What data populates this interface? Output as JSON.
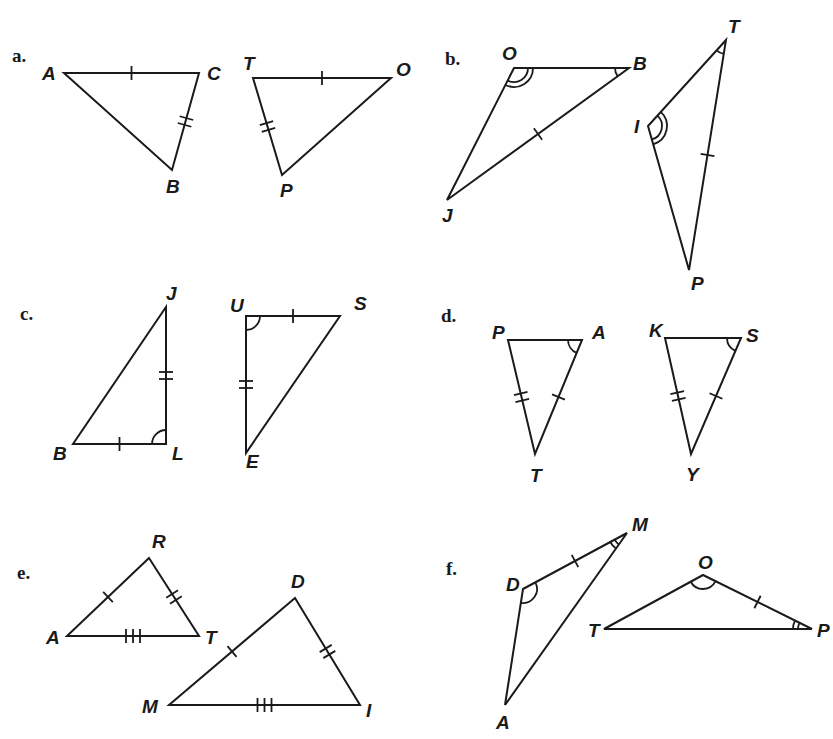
{
  "problems": [
    {
      "label": "a.",
      "label_pos": [
        12,
        62
      ],
      "triangles": [
        {
          "name": "ABC",
          "vertices": {
            "A": [
              64,
              73
            ],
            "C": [
              199,
              73
            ],
            "B": [
              172,
              170
            ]
          },
          "label_pos": {
            "A": [
              42,
              80
            ],
            "C": [
              207,
              80
            ],
            "B": [
              166,
              193
            ]
          },
          "ticks": [
            {
              "side": [
                "A",
                "C"
              ],
              "count": 1
            },
            {
              "side": [
                "C",
                "B"
              ],
              "count": 2
            }
          ],
          "arcs": []
        },
        {
          "name": "TOP",
          "vertices": {
            "T": [
              253,
              78
            ],
            "O": [
              391,
              78
            ],
            "P": [
              282,
              175
            ]
          },
          "label_pos": {
            "T": [
              243,
              70
            ],
            "O": [
              396,
              76
            ],
            "P": [
              280,
              197
            ]
          },
          "ticks": [
            {
              "side": [
                "T",
                "O"
              ],
              "count": 1
            },
            {
              "side": [
                "T",
                "P"
              ],
              "count": 2
            }
          ],
          "arcs": []
        }
      ]
    },
    {
      "label": "b.",
      "label_pos": [
        445,
        65
      ],
      "triangles": [
        {
          "name": "OBJ",
          "vertices": {
            "O": [
              514,
              68
            ],
            "B": [
              629,
              68
            ],
            "J": [
              447,
              200
            ]
          },
          "label_pos": {
            "O": [
              502,
              60
            ],
            "B": [
              633,
              70
            ],
            "J": [
              442,
              222
            ]
          },
          "ticks": [
            {
              "side": [
                "B",
                "J"
              ],
              "count": 1
            }
          ],
          "arcs": [
            {
              "at": "O",
              "count": 2
            },
            {
              "at": "B",
              "count": 1
            }
          ]
        },
        {
          "name": "TIP",
          "vertices": {
            "T": [
              726,
              40
            ],
            "I": [
              648,
              126
            ],
            "P": [
              689,
              270
            ]
          },
          "label_pos": {
            "T": [
              728,
              33
            ],
            "I": [
              634,
              133
            ],
            "P": [
              691,
              290
            ]
          },
          "ticks": [
            {
              "side": [
                "T",
                "P"
              ],
              "count": 1
            }
          ],
          "arcs": [
            {
              "at": "I",
              "count": 2
            },
            {
              "at": "T",
              "count": 1
            }
          ]
        }
      ]
    },
    {
      "label": "c.",
      "label_pos": [
        20,
        320
      ],
      "triangles": [
        {
          "name": "JLB",
          "vertices": {
            "J": [
              166,
              307
            ],
            "L": [
              166,
              444
            ],
            "B": [
              73,
              444
            ]
          },
          "label_pos": {
            "J": [
              166,
              300
            ],
            "L": [
              172,
              460
            ],
            "B": [
              53,
              460
            ]
          },
          "ticks": [
            {
              "side": [
                "B",
                "L"
              ],
              "count": 1
            },
            {
              "side": [
                "J",
                "L"
              ],
              "count": 2
            }
          ],
          "arcs": [
            {
              "at": "L",
              "count": 1
            }
          ]
        },
        {
          "name": "USE",
          "vertices": {
            "U": [
              246,
              316
            ],
            "S": [
              340,
              316
            ],
            "E": [
              246,
              453
            ]
          },
          "label_pos": {
            "U": [
              230,
              312
            ],
            "S": [
              354,
              310
            ],
            "E": [
              246,
              468
            ]
          },
          "ticks": [
            {
              "side": [
                "U",
                "S"
              ],
              "count": 1
            },
            {
              "side": [
                "U",
                "E"
              ],
              "count": 2
            }
          ],
          "arcs": [
            {
              "at": "U",
              "count": 1
            }
          ]
        }
      ]
    },
    {
      "label": "d.",
      "label_pos": [
        441,
        322
      ],
      "triangles": [
        {
          "name": "PAT",
          "vertices": {
            "P": [
              508,
              340
            ],
            "A": [
              582,
              340
            ],
            "T": [
              535,
              454
            ]
          },
          "label_pos": {
            "P": [
              492,
              339
            ],
            "A": [
              592,
              339
            ],
            "T": [
              530,
              482
            ]
          },
          "ticks": [
            {
              "side": [
                "A",
                "T"
              ],
              "count": 1
            },
            {
              "side": [
                "P",
                "T"
              ],
              "count": 2
            }
          ],
          "arcs": [
            {
              "at": "A",
              "count": 1
            }
          ]
        },
        {
          "name": "KSY",
          "vertices": {
            "K": [
              665,
              338
            ],
            "S": [
              741,
              338
            ],
            "Y": [
              691,
              454
            ]
          },
          "label_pos": {
            "K": [
              649,
              337
            ],
            "S": [
              746,
              342
            ],
            "Y": [
              686,
              481
            ]
          },
          "ticks": [
            {
              "side": [
                "S",
                "Y"
              ],
              "count": 1
            },
            {
              "side": [
                "K",
                "Y"
              ],
              "count": 2
            }
          ],
          "arcs": [
            {
              "at": "S",
              "count": 1
            }
          ]
        }
      ]
    },
    {
      "label": "e.",
      "label_pos": [
        17,
        579
      ],
      "triangles": [
        {
          "name": "RAT",
          "vertices": {
            "R": [
              149,
              558
            ],
            "A": [
              67,
              636
            ],
            "T": [
              199,
              636
            ]
          },
          "label_pos": {
            "R": [
              152,
              548
            ],
            "A": [
              46,
              644
            ],
            "T": [
              205,
              644
            ]
          },
          "ticks": [
            {
              "side": [
                "A",
                "R"
              ],
              "count": 1
            },
            {
              "side": [
                "R",
                "T"
              ],
              "count": 2
            },
            {
              "side": [
                "A",
                "T"
              ],
              "count": 3
            }
          ],
          "arcs": []
        },
        {
          "name": "DMI",
          "vertices": {
            "D": [
              295,
              598
            ],
            "M": [
              169,
              705
            ],
            "I": [
              360,
              705
            ]
          },
          "label_pos": {
            "D": [
              291,
              588
            ],
            "M": [
              142,
              713
            ],
            "I": [
              366,
              717
            ]
          },
          "ticks": [
            {
              "side": [
                "M",
                "D"
              ],
              "count": 1
            },
            {
              "side": [
                "D",
                "I"
              ],
              "count": 2
            },
            {
              "side": [
                "M",
                "I"
              ],
              "count": 3
            }
          ],
          "arcs": []
        }
      ]
    },
    {
      "label": "f.",
      "label_pos": [
        446,
        575
      ],
      "triangles": [
        {
          "name": "MDA",
          "vertices": {
            "M": [
              627,
              533
            ],
            "D": [
              523,
              589
            ],
            "A": [
              505,
              705
            ]
          },
          "label_pos": {
            "M": [
              632,
              531
            ],
            "D": [
              506,
              591
            ],
            "A": [
              496,
              729
            ]
          },
          "ticks": [
            {
              "side": [
                "D",
                "M"
              ],
              "count": 1
            }
          ],
          "arcs": [
            {
              "at": "D",
              "count": 1
            },
            {
              "at": "M",
              "count": 2
            }
          ]
        },
        {
          "name": "OTP",
          "vertices": {
            "O": [
              703,
              575
            ],
            "T": [
              604,
              629
            ],
            "P": [
              812,
              629
            ]
          },
          "label_pos": {
            "O": [
              698,
              569
            ],
            "T": [
              588,
              637
            ],
            "P": [
              817,
              637
            ]
          },
          "ticks": [
            {
              "side": [
                "O",
                "P"
              ],
              "count": 1
            }
          ],
          "arcs": [
            {
              "at": "O",
              "count": 1
            },
            {
              "at": "P",
              "count": 2
            }
          ]
        }
      ]
    }
  ]
}
